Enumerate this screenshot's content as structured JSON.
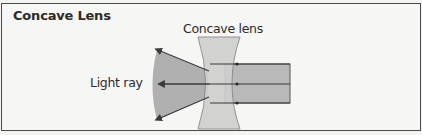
{
  "title": "Concave Lens",
  "labels": {
    "lens": "Concave lens",
    "ray": "Light ray"
  },
  "colors": {
    "border": "#4a4a4a",
    "background": "#f6f6f4",
    "beam_fill": "#b4b4b4",
    "lens_fill": "#c8c8c8",
    "lens_stroke": "#888888",
    "ray_line": "#3a3a3a",
    "text": "#2b2b2b"
  },
  "diagram": {
    "incoming_rays": 3
  }
}
